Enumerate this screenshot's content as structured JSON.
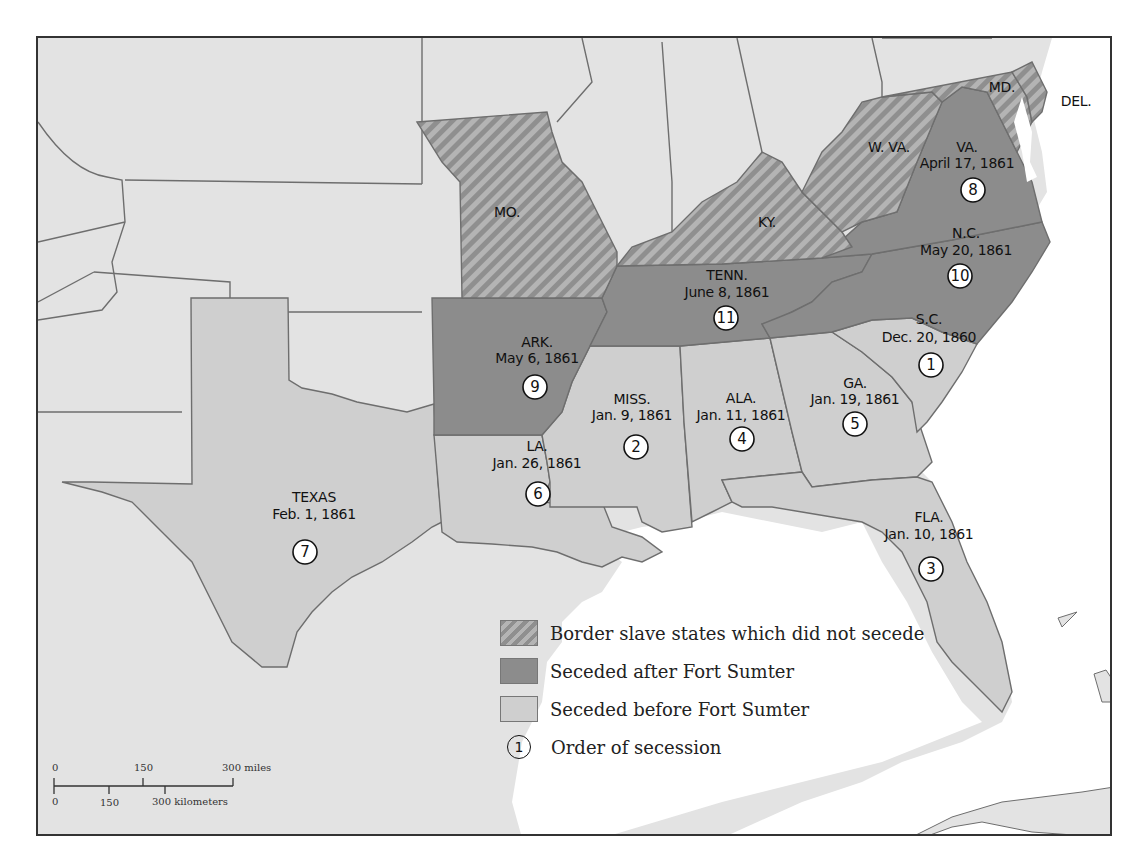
{
  "map": {
    "title": "",
    "states": [
      {
        "abbr": "S.C.",
        "date": "Dec. 20, 1860",
        "order": "1",
        "category": "before"
      },
      {
        "abbr": "MISS.",
        "date": "Jan. 9, 1861",
        "order": "2",
        "category": "before"
      },
      {
        "abbr": "FLA.",
        "date": "Jan. 10, 1861",
        "order": "3",
        "category": "before"
      },
      {
        "abbr": "ALA.",
        "date": "Jan. 11, 1861",
        "order": "4",
        "category": "before"
      },
      {
        "abbr": "GA.",
        "date": "Jan. 19, 1861",
        "order": "5",
        "category": "before"
      },
      {
        "abbr": "LA.",
        "date": "Jan. 26, 1861",
        "order": "6",
        "category": "before"
      },
      {
        "abbr": "TEXAS",
        "date": "Feb. 1, 1861",
        "order": "7",
        "category": "before"
      },
      {
        "abbr": "VA.",
        "date": "April 17, 1861",
        "order": "8",
        "category": "after"
      },
      {
        "abbr": "ARK.",
        "date": "May 6, 1861",
        "order": "9",
        "category": "after"
      },
      {
        "abbr": "N.C.",
        "date": "May 20, 1861",
        "order": "10",
        "category": "after"
      },
      {
        "abbr": "TENN.",
        "date": "June 8, 1861",
        "order": "11",
        "category": "after"
      }
    ],
    "border_states": [
      {
        "abbr": "MO."
      },
      {
        "abbr": "KY."
      },
      {
        "abbr": "W. VA."
      },
      {
        "abbr": "MD."
      },
      {
        "abbr": "DEL."
      }
    ]
  },
  "legend": {
    "items": [
      {
        "label": "Border slave states which did not secede",
        "swatch": "hatched"
      },
      {
        "label": "Seceded after Fort Sumter",
        "swatch": "dark"
      },
      {
        "label": "Seceded before Fort Sumter",
        "swatch": "light"
      },
      {
        "label": "Order of secession",
        "symbol": "1"
      }
    ]
  },
  "scale_bar": {
    "miles": {
      "ticks": [
        "0",
        "150",
        "300 miles"
      ]
    },
    "kilometers": {
      "ticks": [
        "0",
        "150",
        "300 kilometers"
      ]
    }
  },
  "colors": {
    "other_land": "#e3e3e3",
    "seceded_before": "#cfcfcf",
    "seceded_after": "#8c8c8c",
    "border_hatch_dark": "#8f8f8f",
    "border_hatch_light": "#b4b4b4",
    "water": "#ffffff",
    "state_lines": "#6e6e6e"
  }
}
